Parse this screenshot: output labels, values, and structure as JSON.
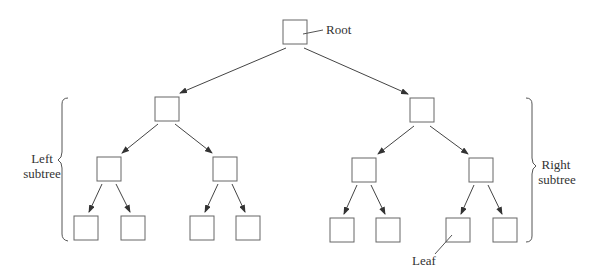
{
  "labels": {
    "root": "Root",
    "left_subtree_line1": "Left",
    "left_subtree_line2": "subtree",
    "right_subtree_line1": "Right",
    "right_subtree_line2": "subtree",
    "leaf": "Leaf"
  },
  "colors": {
    "stroke": "#555555",
    "text": "#333333",
    "background": "#ffffff"
  },
  "tree": {
    "levels": 4,
    "node_count": 15,
    "description": "Complete binary tree with root, left subtree and right subtree annotated; one leaf labeled"
  }
}
